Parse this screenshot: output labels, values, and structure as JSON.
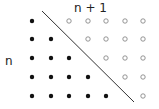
{
  "labels": {
    "top": "n + 1",
    "left": "n"
  },
  "grid": {
    "rows": 5,
    "columns": 6,
    "filled_per_row": [
      1,
      2,
      3,
      4,
      5
    ],
    "hollow_per_row": [
      5,
      4,
      3,
      2,
      1
    ]
  },
  "colors": {
    "filled": "#111111",
    "hollow_stroke": "#888888",
    "line": "#333333",
    "text": "#222222"
  }
}
